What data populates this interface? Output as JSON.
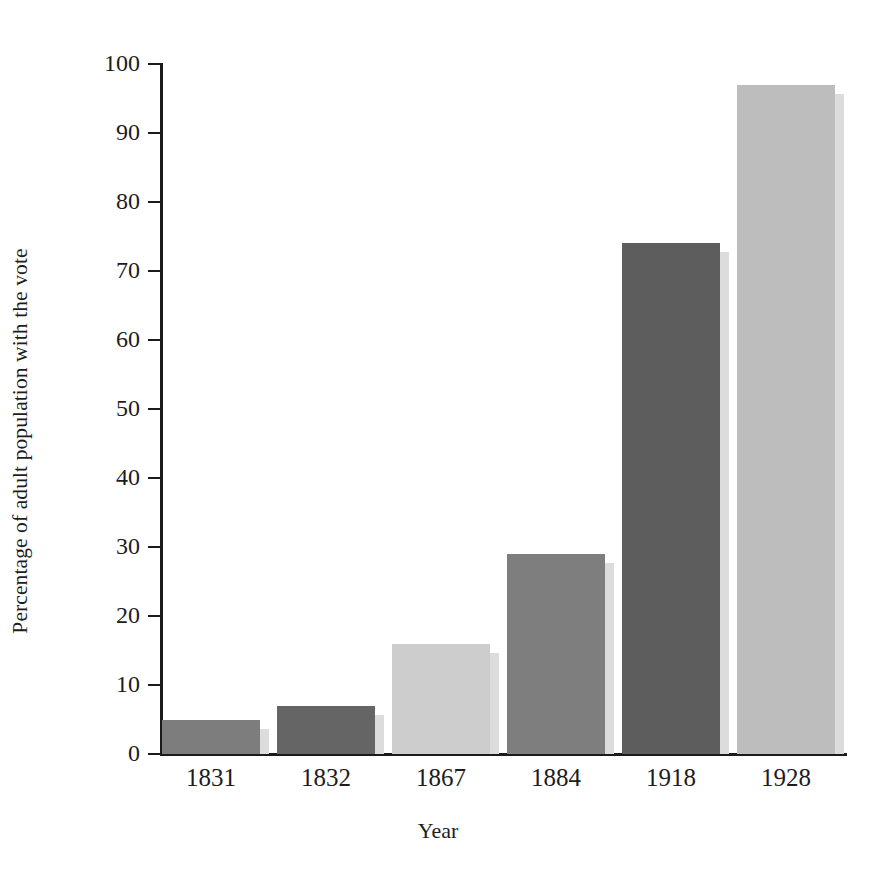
{
  "chart_data": {
    "type": "bar",
    "title": "",
    "xlabel": "Year",
    "ylabel": "Percentage of adult population with the vote",
    "categories": [
      "1831",
      "1832",
      "1867",
      "1884",
      "1918",
      "1928"
    ],
    "values": [
      5,
      7,
      16,
      29,
      74,
      97
    ],
    "ylim": [
      0,
      100
    ],
    "ytick_labels": [
      "0",
      "10",
      "20",
      "30",
      "40",
      "50",
      "60",
      "70",
      "80",
      "90",
      "100"
    ],
    "ytick_values": [
      0,
      10,
      20,
      30,
      40,
      50,
      60,
      70,
      80,
      90,
      100
    ],
    "grid": false,
    "legend": false,
    "bar_colors": [
      "#7d7d7d",
      "#656565",
      "#cdcdcd",
      "#7e7e7e",
      "#5d5d5d",
      "#bdbdbd"
    ],
    "shadow_color": "#dcdcdc",
    "axis_color": "#1b1b1b",
    "background_color": "#ffffff"
  }
}
